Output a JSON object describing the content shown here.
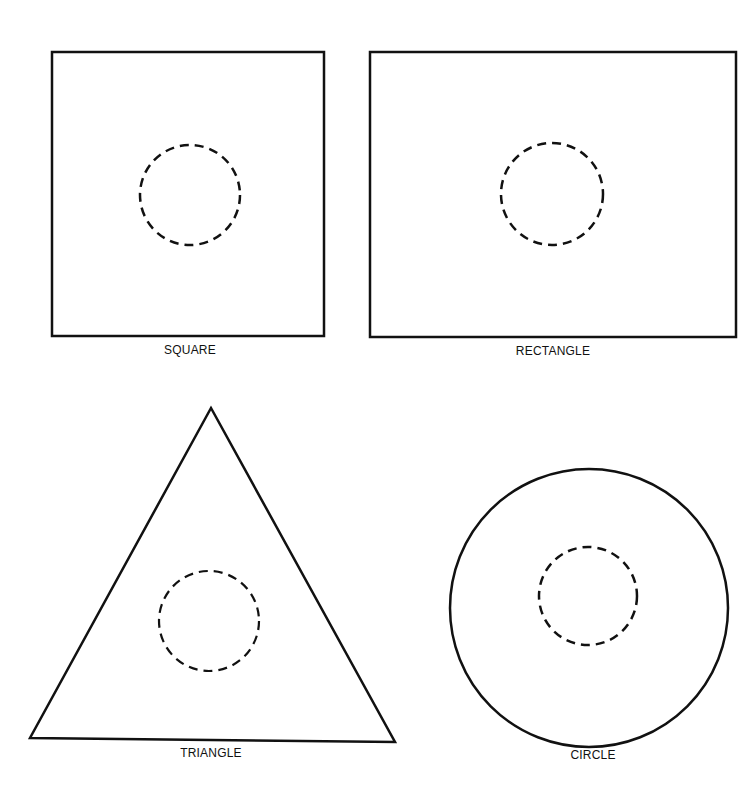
{
  "title": "",
  "colors": {
    "stroke": "#111111",
    "background": "#ffffff"
  },
  "shapes": [
    {
      "id": "square",
      "label": "SQUARE",
      "type": "rect",
      "x": 52,
      "y": 52,
      "width": 272,
      "height": 284,
      "inner_circle": {
        "cx": 190,
        "cy": 195,
        "r": 50,
        "style": "dashed"
      },
      "label_pos": {
        "x": 190,
        "y": 343
      }
    },
    {
      "id": "rectangle",
      "label": "RECTANGLE",
      "type": "rect",
      "x": 370,
      "y": 52,
      "width": 366,
      "height": 285,
      "inner_circle": {
        "cx": 552,
        "cy": 194,
        "r": 51,
        "style": "dashed"
      },
      "label_pos": {
        "x": 553,
        "y": 344
      }
    },
    {
      "id": "triangle",
      "label": "TRIANGLE",
      "type": "polygon",
      "points": "211,408 30,738 395,742",
      "inner_circle": {
        "cx": 209,
        "cy": 621,
        "r": 50,
        "style": "dashed"
      },
      "label_pos": {
        "x": 211,
        "y": 746
      }
    },
    {
      "id": "circle",
      "label": "CIRCLE",
      "type": "circle",
      "cx": 589,
      "cy": 608,
      "r": 139,
      "inner_circle": {
        "cx": 588,
        "cy": 596,
        "r": 49,
        "style": "dashed"
      },
      "label_pos": {
        "x": 593,
        "y": 748
      }
    }
  ]
}
